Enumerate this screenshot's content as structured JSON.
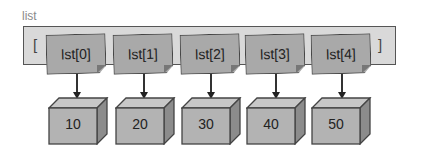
{
  "diagram": {
    "title": "list",
    "open_bracket": "[",
    "close_bracket": "]",
    "references": [
      {
        "label": "lst[0]",
        "x": 46
      },
      {
        "label": "lst[1]",
        "x": 113
      },
      {
        "label": "lst[2]",
        "x": 180
      },
      {
        "label": "lst[3]",
        "x": 245
      },
      {
        "label": "lst[4]",
        "x": 311
      }
    ],
    "values": [
      {
        "label": "10",
        "x": 48
      },
      {
        "label": "20",
        "x": 115
      },
      {
        "label": "30",
        "x": 181
      },
      {
        "label": "40",
        "x": 246
      },
      {
        "label": "50",
        "x": 311
      }
    ],
    "colors": {
      "container_fill": "#d9d9d9",
      "ref_fill": "#a9a9a9",
      "box_front": "#b3b3b3",
      "box_top": "#c7c7c7",
      "box_side": "#8c8c8c",
      "stroke": "#444444"
    }
  }
}
